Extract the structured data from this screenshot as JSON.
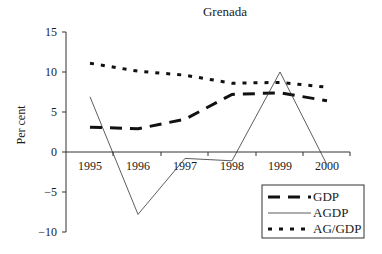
{
  "chart_data": {
    "type": "line",
    "title": "Grenada",
    "xlabel": "",
    "ylabel": "Per cent",
    "categories": [
      "1995",
      "1996",
      "1997",
      "1998",
      "1999",
      "2000"
    ],
    "ylim": [
      -10,
      15
    ],
    "yticks": [
      "15",
      "10",
      "5",
      "0",
      "−5",
      "−10"
    ],
    "grid": false,
    "legend_position": "lower right",
    "series": [
      {
        "name": "GDP",
        "style": "long-dash-thick",
        "values": [
          3.1,
          2.9,
          4.1,
          7.2,
          7.4,
          6.4
        ]
      },
      {
        "name": "AGDP",
        "style": "solid-thin",
        "values": [
          6.9,
          -7.8,
          -0.8,
          -1.1,
          10.0,
          -1.6
        ]
      },
      {
        "name": "AG/GDP",
        "style": "short-dash-thick",
        "values": [
          11.1,
          10.1,
          9.6,
          8.6,
          8.7,
          8.1
        ]
      }
    ]
  },
  "labels": {
    "title": "Grenada",
    "ylabel": "Per cent",
    "yticks": [
      "15",
      "10",
      "5",
      "0",
      "−5",
      "−10"
    ],
    "xticks": [
      "1995",
      "1996",
      "1997",
      "1998",
      "1999",
      "2000"
    ],
    "legend": [
      "GDP",
      "AGDP",
      "AG/GDP"
    ]
  }
}
